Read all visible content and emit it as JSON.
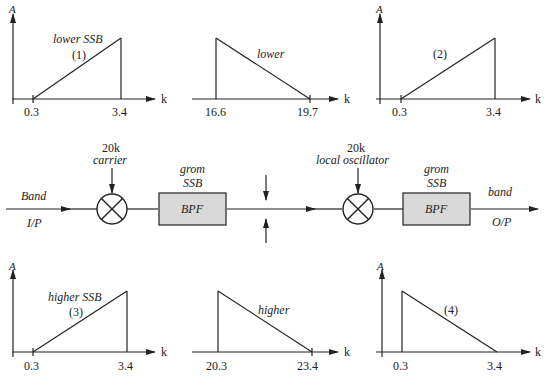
{
  "spectra": [
    {
      "id": 1,
      "axis_y": "A",
      "axis_x": "k",
      "ticks": [
        "0.3",
        "3.4"
      ],
      "label": "lower SSB",
      "tag": "(1)",
      "shape": "rising"
    },
    {
      "id": "lower",
      "axis_x": "k",
      "ticks": [
        "16.6",
        "19.7"
      ],
      "label": "lower",
      "shape": "falling"
    },
    {
      "id": 2,
      "axis_y": "A",
      "axis_x": "k",
      "ticks": [
        "0.3",
        "3.4"
      ],
      "label": "",
      "tag": "(2)",
      "shape": "rising"
    },
    {
      "id": 3,
      "axis_y": "A",
      "axis_x": "k",
      "ticks": [
        "0.3",
        "3.4"
      ],
      "label": "higher SSB",
      "tag": "(3)",
      "shape": "rising"
    },
    {
      "id": "higher",
      "axis_x": "k",
      "ticks": [
        "20.3",
        "23.4"
      ],
      "label": "higher",
      "shape": "falling"
    },
    {
      "id": 4,
      "axis_y": "A",
      "axis_x": "k",
      "ticks": [
        "0.3",
        "3.4"
      ],
      "label": "",
      "tag": "(4)",
      "shape": "falling"
    }
  ],
  "block": {
    "input_top": "Band",
    "input_bottom": "I/P",
    "mixer1_freq": "20k",
    "mixer1_label": "carrier",
    "filter1_top1": "grom",
    "filter1_top2": "SSB",
    "filter1_label": "BPF",
    "mixer2_freq": "20k",
    "mixer2_label": "local oscillator",
    "filter2_top1": "grom",
    "filter2_top2": "SSB",
    "filter2_label": "BPF",
    "output_top": "band",
    "output_bottom": "O/P"
  },
  "colors": {
    "line": "#222222",
    "filter_fill": "#d9d9d9"
  }
}
